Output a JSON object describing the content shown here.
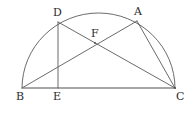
{
  "figure": {
    "type": "geometry-diagram",
    "stroke_color": "#5a5a5a",
    "baseline_color": "#808080",
    "label_color": "#2b2b2b",
    "background_color": "#ffffff",
    "canvas": {
      "width": 195,
      "height": 115
    }
  },
  "points": [
    {
      "id": "B",
      "label": "B",
      "x": 22,
      "y": 88,
      "label_x": 16,
      "label_y": 91,
      "on_arc": true,
      "role": "diameter-endpoint-left"
    },
    {
      "id": "C",
      "label": "C",
      "x": 175,
      "y": 88,
      "label_x": 176,
      "label_y": 91,
      "on_arc": true,
      "role": "diameter-endpoint-right"
    },
    {
      "id": "D",
      "label": "D",
      "x": 58,
      "y": 22,
      "label_x": 53,
      "label_y": 7,
      "on_arc": true,
      "role": "arc-point-left"
    },
    {
      "id": "A",
      "label": "A",
      "x": 137,
      "y": 21,
      "label_x": 134,
      "label_y": 6,
      "on_arc": true,
      "role": "arc-point-right"
    },
    {
      "id": "E",
      "label": "E",
      "x": 58,
      "y": 88,
      "label_x": 53,
      "label_y": 91,
      "on_arc": false,
      "role": "foot-of-perpendicular"
    },
    {
      "id": "F",
      "label": "F",
      "x": 95,
      "y": 43,
      "label_x": 91,
      "label_y": 28,
      "on_arc": false,
      "role": "intersection-of-chords"
    }
  ],
  "segments": [
    {
      "id": "BC",
      "name": "diameter-bc",
      "from": "B",
      "to": "C",
      "kind": "baseline"
    },
    {
      "id": "DE",
      "name": "perpendicular-de",
      "from": "D",
      "to": "E",
      "kind": "chord"
    },
    {
      "id": "DC",
      "name": "chord-dc",
      "from": "D",
      "to": "C",
      "kind": "chord"
    },
    {
      "id": "BA",
      "name": "chord-ba",
      "from": "B",
      "to": "A",
      "kind": "chord"
    },
    {
      "id": "AC",
      "name": "chord-ac",
      "from": "A",
      "to": "C",
      "kind": "chord"
    }
  ],
  "arc": {
    "name": "semicircle-arc-bc",
    "center_x": 98.5,
    "center_y": 88,
    "radius_x": 76.5,
    "radius_y": 75,
    "start": "B",
    "end": "C",
    "apex_y": 13
  }
}
